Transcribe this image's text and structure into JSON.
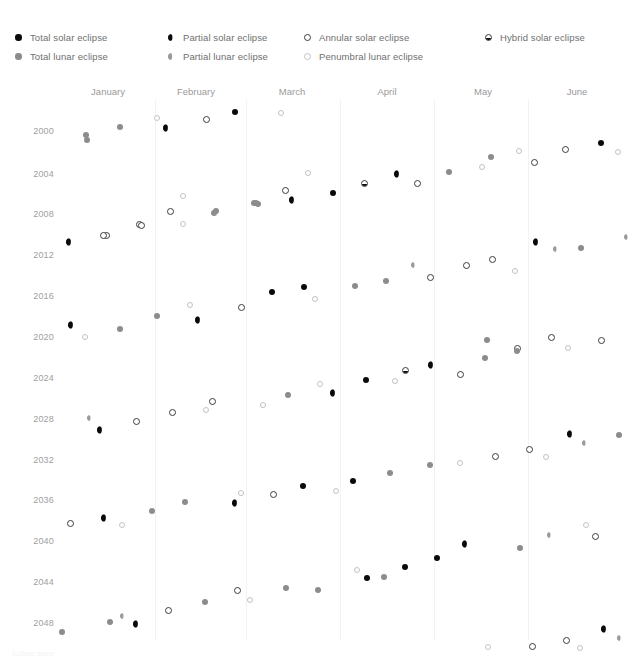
{
  "legend": {
    "columns": [
      {
        "x": 14,
        "entries": [
          {
            "type": "total_solar",
            "label": "Total solar eclipse"
          },
          {
            "type": "total_lunar",
            "label": "Total lunar eclipse"
          }
        ]
      },
      {
        "x": 167,
        "entries": [
          {
            "type": "partial_solar",
            "label": "Partial solar eclipse"
          },
          {
            "type": "partial_lunar",
            "label": "Partial lunar eclipse"
          }
        ]
      },
      {
        "x": 303,
        "entries": [
          {
            "type": "annular_solar",
            "label": "Annular solar eclipse"
          },
          {
            "type": "penumbral_lunar",
            "label": "Penumbral lunar eclipse"
          }
        ]
      },
      {
        "x": 484,
        "entries": [
          {
            "type": "hybrid_solar",
            "label": "Hybrid solar eclipse"
          }
        ]
      }
    ]
  },
  "footer": {
    "note": "Eclipse dates"
  },
  "chart_data": {
    "type": "scatter",
    "title": "",
    "xlabel": "",
    "ylabel": "",
    "grid": true,
    "legend_position": "top",
    "xlim": [
      0,
      6
    ],
    "ylim": [
      2000,
      2050
    ],
    "categories": [
      "January",
      "February",
      "March",
      "April",
      "May",
      "June"
    ],
    "month_centers": [
      108,
      196,
      292,
      387,
      483,
      577
    ],
    "gridlines": [
      155,
      246,
      340,
      434,
      528
    ],
    "ytick_labels": [
      "2000",
      "2004",
      "2008",
      "2012",
      "2016",
      "2020",
      "2024",
      "2028",
      "2032",
      "2036",
      "2040",
      "2044",
      "2048"
    ],
    "ytick_values": [
      2000,
      2004,
      2008,
      2012,
      2016,
      2020,
      2024,
      2028,
      2032,
      2036,
      2040,
      2044,
      2048
    ],
    "ytick_y": [
      131,
      174,
      214,
      255,
      296,
      337,
      378,
      419,
      460,
      500,
      541,
      582,
      623
    ],
    "series": [
      {
        "name": "Total solar eclipse",
        "type": "total_solar"
      },
      {
        "name": "Total lunar eclipse",
        "type": "total_lunar"
      },
      {
        "name": "Partial solar eclipse",
        "type": "partial_solar"
      },
      {
        "name": "Partial lunar eclipse",
        "type": "partial_lunar"
      },
      {
        "name": "Annular solar eclipse",
        "type": "annular_solar"
      },
      {
        "name": "Penumbral lunar eclipse",
        "type": "penumbral_lunar"
      },
      {
        "name": "Hybrid solar eclipse",
        "type": "hybrid_solar"
      }
    ],
    "points": [
      {
        "x": 86,
        "y": 135,
        "type": "total_lunar"
      },
      {
        "x": 120,
        "y": 127,
        "type": "total_lunar"
      },
      {
        "x": 157,
        "y": 118,
        "type": "penumbral_lunar"
      },
      {
        "x": 167,
        "y": 128,
        "type": "partial_solar"
      },
      {
        "x": 206,
        "y": 119,
        "type": "annular_solar"
      },
      {
        "x": 235,
        "y": 112,
        "type": "total_solar"
      },
      {
        "x": 281,
        "y": 113,
        "type": "penumbral_lunar"
      },
      {
        "x": 87,
        "y": 140,
        "type": "total_lunar"
      },
      {
        "x": 491,
        "y": 157,
        "type": "total_lunar"
      },
      {
        "x": 519,
        "y": 151,
        "type": "penumbral_lunar"
      },
      {
        "x": 534,
        "y": 162,
        "type": "annular_solar"
      },
      {
        "x": 565,
        "y": 149,
        "type": "annular_solar"
      },
      {
        "x": 601,
        "y": 143,
        "type": "total_solar"
      },
      {
        "x": 618,
        "y": 152,
        "type": "penumbral_lunar"
      },
      {
        "x": 285,
        "y": 190,
        "type": "annular_solar"
      },
      {
        "x": 308,
        "y": 173,
        "type": "penumbral_lunar"
      },
      {
        "x": 333,
        "y": 193,
        "type": "total_solar"
      },
      {
        "x": 364,
        "y": 183,
        "type": "hybrid_solar"
      },
      {
        "x": 398,
        "y": 174,
        "type": "partial_solar"
      },
      {
        "x": 417,
        "y": 183,
        "type": "annular_solar"
      },
      {
        "x": 449,
        "y": 172,
        "type": "total_lunar"
      },
      {
        "x": 170,
        "y": 211,
        "type": "annular_solar"
      },
      {
        "x": 139,
        "y": 224,
        "type": "annular_solar"
      },
      {
        "x": 106,
        "y": 235,
        "type": "annular_solar"
      },
      {
        "x": 183,
        "y": 196,
        "type": "penumbral_lunar"
      },
      {
        "x": 216,
        "y": 211,
        "type": "total_lunar"
      },
      {
        "x": 254,
        "y": 203,
        "type": "total_lunar"
      },
      {
        "x": 293,
        "y": 200,
        "type": "partial_solar"
      },
      {
        "x": 482,
        "y": 167,
        "type": "penumbral_lunar"
      },
      {
        "x": 256,
        "y": 203,
        "type": "total_lunar"
      },
      {
        "x": 70,
        "y": 242,
        "type": "partial_solar"
      },
      {
        "x": 103,
        "y": 235,
        "type": "annular_solar"
      },
      {
        "x": 141,
        "y": 225,
        "type": "annular_solar"
      },
      {
        "x": 183,
        "y": 224,
        "type": "penumbral_lunar"
      },
      {
        "x": 214,
        "y": 213,
        "type": "total_lunar"
      },
      {
        "x": 258,
        "y": 204,
        "type": "total_lunar"
      },
      {
        "x": 537,
        "y": 242,
        "type": "partial_solar"
      },
      {
        "x": 556,
        "y": 249,
        "type": "partial_lunar"
      },
      {
        "x": 581,
        "y": 248,
        "type": "total_lunar"
      },
      {
        "x": 627,
        "y": 237,
        "type": "partial_lunar"
      },
      {
        "x": 414,
        "y": 265,
        "type": "partial_lunar"
      },
      {
        "x": 430,
        "y": 277,
        "type": "annular_solar"
      },
      {
        "x": 466,
        "y": 265,
        "type": "annular_solar"
      },
      {
        "x": 492,
        "y": 259,
        "type": "annular_solar"
      },
      {
        "x": 515,
        "y": 271,
        "type": "penumbral_lunar"
      },
      {
        "x": 386,
        "y": 281,
        "type": "total_lunar"
      },
      {
        "x": 355,
        "y": 286,
        "type": "total_lunar"
      },
      {
        "x": 272,
        "y": 292,
        "type": "total_solar"
      },
      {
        "x": 304,
        "y": 287,
        "type": "total_solar"
      },
      {
        "x": 315,
        "y": 299,
        "type": "penumbral_lunar"
      },
      {
        "x": 241,
        "y": 307,
        "type": "annular_solar"
      },
      {
        "x": 190,
        "y": 305,
        "type": "penumbral_lunar"
      },
      {
        "x": 157,
        "y": 316,
        "type": "total_lunar"
      },
      {
        "x": 72,
        "y": 325,
        "type": "partial_solar"
      },
      {
        "x": 85,
        "y": 337,
        "type": "penumbral_lunar"
      },
      {
        "x": 120,
        "y": 329,
        "type": "total_lunar"
      },
      {
        "x": 199,
        "y": 320,
        "type": "partial_solar"
      },
      {
        "x": 487,
        "y": 340,
        "type": "total_lunar"
      },
      {
        "x": 517,
        "y": 348,
        "type": "annular_solar"
      },
      {
        "x": 551,
        "y": 337,
        "type": "annular_solar"
      },
      {
        "x": 568,
        "y": 348,
        "type": "penumbral_lunar"
      },
      {
        "x": 601,
        "y": 340,
        "type": "annular_solar"
      },
      {
        "x": 460,
        "y": 374,
        "type": "annular_solar"
      },
      {
        "x": 432,
        "y": 365,
        "type": "partial_solar"
      },
      {
        "x": 405,
        "y": 370,
        "type": "hybrid_solar"
      },
      {
        "x": 395,
        "y": 381,
        "type": "penumbral_lunar"
      },
      {
        "x": 366,
        "y": 380,
        "type": "total_solar"
      },
      {
        "x": 334,
        "y": 393,
        "type": "partial_solar"
      },
      {
        "x": 320,
        "y": 384,
        "type": "penumbral_lunar"
      },
      {
        "x": 485,
        "y": 358,
        "type": "total_lunar"
      },
      {
        "x": 517,
        "y": 351,
        "type": "total_lunar"
      },
      {
        "x": 288,
        "y": 395,
        "type": "total_lunar"
      },
      {
        "x": 263,
        "y": 405,
        "type": "penumbral_lunar"
      },
      {
        "x": 212,
        "y": 401,
        "type": "annular_solar"
      },
      {
        "x": 206,
        "y": 410,
        "type": "penumbral_lunar"
      },
      {
        "x": 172,
        "y": 412,
        "type": "annular_solar"
      },
      {
        "x": 90,
        "y": 418,
        "type": "partial_lunar"
      },
      {
        "x": 101,
        "y": 430,
        "type": "partial_solar"
      },
      {
        "x": 136,
        "y": 421,
        "type": "annular_solar"
      },
      {
        "x": 529,
        "y": 449,
        "type": "annular_solar"
      },
      {
        "x": 546,
        "y": 457,
        "type": "penumbral_lunar"
      },
      {
        "x": 571,
        "y": 434,
        "type": "partial_solar"
      },
      {
        "x": 585,
        "y": 443,
        "type": "partial_lunar"
      },
      {
        "x": 619,
        "y": 435,
        "type": "total_lunar"
      },
      {
        "x": 495,
        "y": 456,
        "type": "annular_solar"
      },
      {
        "x": 460,
        "y": 463,
        "type": "penumbral_lunar"
      },
      {
        "x": 430,
        "y": 465,
        "type": "total_lunar"
      },
      {
        "x": 390,
        "y": 473,
        "type": "total_lunar"
      },
      {
        "x": 353,
        "y": 481,
        "type": "total_solar"
      },
      {
        "x": 336,
        "y": 491,
        "type": "penumbral_lunar"
      },
      {
        "x": 303,
        "y": 486,
        "type": "total_solar"
      },
      {
        "x": 273,
        "y": 494,
        "type": "annular_solar"
      },
      {
        "x": 241,
        "y": 493,
        "type": "penumbral_lunar"
      },
      {
        "x": 236,
        "y": 503,
        "type": "partial_solar"
      },
      {
        "x": 185,
        "y": 502,
        "type": "total_lunar"
      },
      {
        "x": 152,
        "y": 511,
        "type": "total_lunar"
      },
      {
        "x": 105,
        "y": 518,
        "type": "partial_solar"
      },
      {
        "x": 70,
        "y": 523,
        "type": "annular_solar"
      },
      {
        "x": 122,
        "y": 525,
        "type": "penumbral_lunar"
      },
      {
        "x": 586,
        "y": 525,
        "type": "penumbral_lunar"
      },
      {
        "x": 595,
        "y": 536,
        "type": "annular_solar"
      },
      {
        "x": 550,
        "y": 535,
        "type": "partial_lunar"
      },
      {
        "x": 520,
        "y": 548,
        "type": "total_lunar"
      },
      {
        "x": 466,
        "y": 544,
        "type": "partial_solar"
      },
      {
        "x": 437,
        "y": 558,
        "type": "total_solar"
      },
      {
        "x": 405,
        "y": 567,
        "type": "total_solar"
      },
      {
        "x": 384,
        "y": 577,
        "type": "total_lunar"
      },
      {
        "x": 357,
        "y": 570,
        "type": "penumbral_lunar"
      },
      {
        "x": 367,
        "y": 578,
        "type": "total_solar"
      },
      {
        "x": 318,
        "y": 590,
        "type": "total_lunar"
      },
      {
        "x": 286,
        "y": 588,
        "type": "total_lunar"
      },
      {
        "x": 250,
        "y": 600,
        "type": "penumbral_lunar"
      },
      {
        "x": 237,
        "y": 590,
        "type": "annular_solar"
      },
      {
        "x": 205,
        "y": 602,
        "type": "total_lunar"
      },
      {
        "x": 168,
        "y": 610,
        "type": "annular_solar"
      },
      {
        "x": 123,
        "y": 616,
        "type": "partial_lunar"
      },
      {
        "x": 137,
        "y": 624,
        "type": "partial_solar"
      },
      {
        "x": 110,
        "y": 622,
        "type": "total_lunar"
      },
      {
        "x": 62,
        "y": 632,
        "type": "total_lunar"
      },
      {
        "x": 488,
        "y": 647,
        "type": "penumbral_lunar"
      },
      {
        "x": 532,
        "y": 646,
        "type": "annular_solar"
      },
      {
        "x": 566,
        "y": 640,
        "type": "annular_solar"
      },
      {
        "x": 580,
        "y": 648,
        "type": "penumbral_lunar"
      },
      {
        "x": 605,
        "y": 629,
        "type": "partial_solar"
      },
      {
        "x": 620,
        "y": 638,
        "type": "partial_lunar"
      }
    ]
  }
}
